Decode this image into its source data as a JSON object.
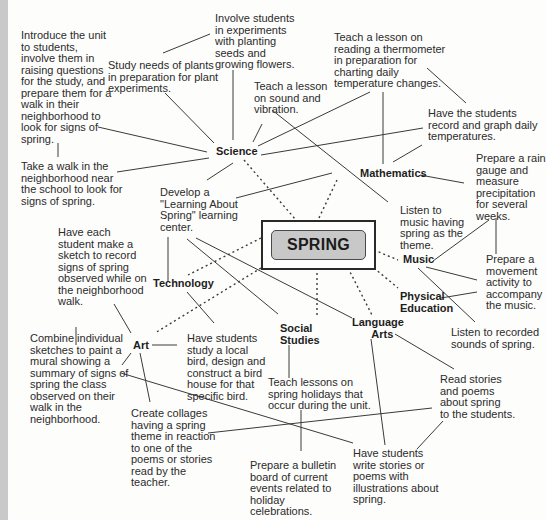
{
  "center": {
    "label": "SPRING"
  },
  "hubs": {
    "science": "Science",
    "mathematics": "Mathematics",
    "music": "Music",
    "physical_education": "Physical\nEducation",
    "language_arts": "Language\n   Arts",
    "social_studies": "Social\nStudies",
    "technology": "Technology",
    "art": "Art"
  },
  "notes": {
    "introduce_unit": "Introduce the unit\nto students,\ninvolve them in\nraising questions\nfor the study, and\nprepare them for a\nwalk in their\nneighborhood to\nlook for signs of\nspring.",
    "study_plants": "Study needs of plants\nin preparation for plant\nexperiments.",
    "involve_experiments": "Involve students\nin experiments\nwith planting\nseeds and\ngrowing flowers.",
    "sound_vibration": "Teach a lesson\non sound and\nvibration.",
    "thermometer": "Teach a lesson on\nreading a thermometer\nin preparation for\ncharting daily\ntemperature changes.",
    "graph_temps": "Have the students\nrecord and graph daily\ntemperatures.",
    "rain_gauge": "Prepare a rain\ngauge and\nmeasure\nprecipitation\nfor several\nweeks.",
    "take_walk": "Take a walk in the\nneighborhood near\nthe school to look for\nsigns of spring.",
    "learning_center": "Develop a\n\"Learning About\nSpring\" learning\ncenter.",
    "listen_music": "Listen to\nmusic having\nspring as the\ntheme.",
    "sketch": "Have each\nstudent make a\nsketch to record\nsigns of spring\nobserved while on\nthe neighborhood\nwalk.",
    "movement_activity": "Prepare a\nmovement\nactivity to\naccompany\nthe music.",
    "recorded_sounds": "Listen to recorded\nsounds of spring.",
    "mural": "Combine individual\nsketches to paint a\nmural showing a\nsummary of signs of\nspring the class\nobserved on their\nwalk in the\nneighborhood.",
    "bird_house": "Have students\nstudy a local\nbird, design and\nconstruct a bird\nhouse for that\nspecific bird.",
    "spring_holidays": "Teach lessons on\nspring holidays that\noccur during the unit.",
    "read_stories": "Read stories\nand poems\nabout spring\nto the students.",
    "collages": "Create collages\nhaving a spring\ntheme in reaction\nto one of the\npoems or stories\nread by the\nteacher.",
    "bulletin_board": "Prepare a bulletin\nboard of current\nevents related to\nholiday\ncelebrations.",
    "write_stories": "Have students\nwrite stories or\npoems with\nillustrations about\nspring."
  }
}
